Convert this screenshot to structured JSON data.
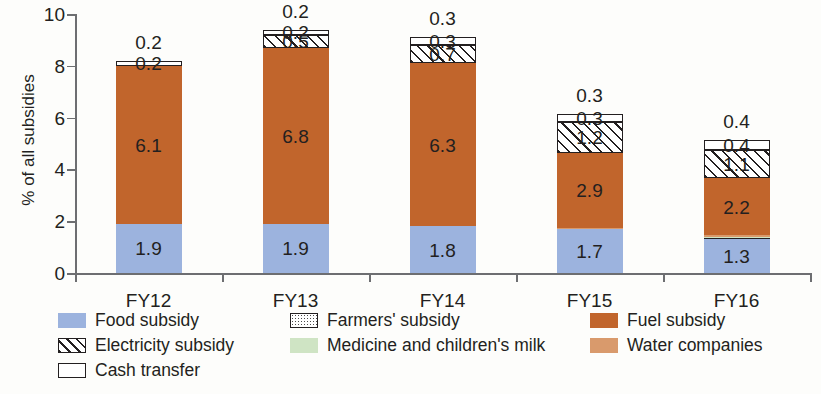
{
  "chart_data": {
    "type": "bar",
    "subtype": "stacked-bar",
    "title": "",
    "xlabel": "",
    "ylabel": "% of all subsidies",
    "ylim": [
      0,
      10
    ],
    "yticks": [
      "0",
      "2",
      "4",
      "6",
      "8",
      "10"
    ],
    "grid": false,
    "legend_position": "bottom",
    "categories": [
      "FY12",
      "FY13",
      "FY14",
      "FY15",
      "FY16"
    ],
    "series": [
      {
        "name": "Food subsidy",
        "color": "#9cb3de",
        "pattern": "solid",
        "values": [
          1.9,
          1.9,
          1.8,
          1.7,
          1.3
        ],
        "labels": [
          "1.9",
          "1.9",
          "1.8",
          "1.7",
          "1.3"
        ]
      },
      {
        "name": "Farmers' subsidy",
        "color": "#ffffff",
        "pattern": "dotted",
        "values": [
          0.0,
          0.0,
          0.0,
          0.0,
          0.05
        ],
        "labels": [
          "",
          "",
          "",
          "",
          ""
        ]
      },
      {
        "name": "Medicine and children's milk",
        "color": "#cfe4c4",
        "pattern": "solid",
        "values": [
          0.0,
          0.0,
          0.0,
          0.0,
          0.05
        ],
        "labels": [
          "",
          "",
          "",
          "",
          ""
        ]
      },
      {
        "name": "Water companies",
        "color": "#d99a6c",
        "pattern": "solid",
        "values": [
          0.0,
          0.0,
          0.0,
          0.05,
          0.05
        ],
        "labels": [
          "",
          "",
          "",
          "",
          ""
        ]
      },
      {
        "name": "Fuel subsidy",
        "color": "#c1652c",
        "pattern": "solid",
        "values": [
          6.1,
          6.8,
          6.3,
          2.9,
          2.2
        ],
        "labels": [
          "6.1",
          "6.8",
          "6.3",
          "2.9",
          "2.2"
        ]
      },
      {
        "name": "Electricity subsidy",
        "color": "#ffffff",
        "pattern": "hatch",
        "values": [
          0.0,
          0.5,
          0.7,
          1.2,
          1.1
        ],
        "labels": [
          "0.0",
          "0.5",
          "0.7",
          "1.2",
          "1.1"
        ]
      },
      {
        "name": "Cash transfer",
        "color": "#ffffff",
        "pattern": "outline",
        "values": [
          0.2,
          0.2,
          0.3,
          0.3,
          0.4
        ],
        "labels": [
          "0.2",
          "0.2",
          "0.3",
          "0.3",
          "0.4"
        ]
      }
    ],
    "top_labels": [
      "0.2",
      "0.2",
      "0.3",
      "0.3",
      "0.4"
    ]
  },
  "axis": {
    "y_title": "% of all subsidies",
    "y_ticks": [
      "0",
      "2",
      "4",
      "6",
      "8",
      "10"
    ],
    "x_categories": [
      "FY12",
      "FY13",
      "FY14",
      "FY15",
      "FY16"
    ]
  },
  "legend": {
    "entries": [
      {
        "label": "Food subsidy",
        "swatch": "sw-food"
      },
      {
        "label": "Farmers' subsidy",
        "swatch": "sw-farmers"
      },
      {
        "label": "Fuel subsidy",
        "swatch": "sw-fuel"
      },
      {
        "label": "Electricity subsidy",
        "swatch": "sw-elec"
      },
      {
        "label": "Medicine and children's milk",
        "swatch": "sw-medicine"
      },
      {
        "label": "Water companies",
        "swatch": "sw-water"
      },
      {
        "label": "Cash transfer",
        "swatch": "sw-cash"
      }
    ]
  },
  "colors": {
    "food": "#9cb3de",
    "fuel": "#c1652c",
    "water": "#d99a6c",
    "medicine": "#cfe4c4",
    "ink": "#231f20",
    "axis": "#6d6e71"
  }
}
